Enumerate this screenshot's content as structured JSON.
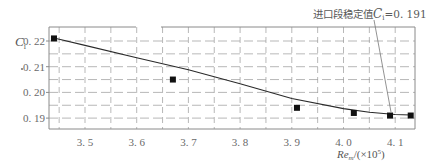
{
  "chart_data": {
    "type": "line",
    "title": "",
    "xlabel": "Re_m/(×10^5)",
    "xlabel_parts": {
      "main": "Re",
      "sub": "m",
      "unit": "/(×10",
      "sup": "5",
      "close": ")"
    },
    "ylabel": "C_i",
    "ylabel_parts": {
      "main": "C",
      "sub": "i"
    },
    "xlim": [
      3.43,
      4.135
    ],
    "ylim": [
      0.1856,
      0.2275
    ],
    "xticks": [
      3.5,
      3.6,
      3.7,
      3.8,
      3.9,
      4.0,
      4.1
    ],
    "xtick_labels": [
      "3. 5",
      "3. 6",
      "3. 7",
      "3. 8",
      "3. 9",
      "4. 0",
      "4. 1"
    ],
    "yticks": [
      0.19,
      0.2,
      0.21,
      0.22
    ],
    "ytick_labels": [
      "0. 19",
      "0. 20",
      "0. 21",
      "0. 22"
    ],
    "grid": {
      "on": true,
      "style": "dashed",
      "x_step": 0.05,
      "y_step": 0.005
    },
    "legend": null,
    "series": [
      {
        "name": "C_i",
        "marker": "square",
        "x": [
          3.44,
          3.67,
          3.91,
          4.02,
          4.09,
          4.13
        ],
        "values": [
          0.221,
          0.205,
          0.194,
          0.192,
          0.191,
          0.191
        ]
      }
    ],
    "fit_curve": {
      "x": [
        3.44,
        3.5,
        3.6,
        3.7,
        3.8,
        3.9,
        4.0,
        4.05,
        4.1,
        4.13
      ],
      "values": [
        0.2212,
        0.2183,
        0.2135,
        0.2088,
        0.2034,
        0.1976,
        0.1937,
        0.1923,
        0.1914,
        0.1912
      ]
    },
    "annotations": [
      {
        "text": "进口段稳定值C_i=0.191",
        "prefix": "进口段稳定值",
        "var": "C",
        "sub": "i",
        "value": "=0. 191",
        "points_to": {
          "x": 4.1,
          "y": 0.191
        }
      }
    ]
  },
  "colors": {
    "frame": "#8a8a8a",
    "grid": "#9a9a9a",
    "curve": "#2a2a2a",
    "marker": "#111111",
    "text": "#666666"
  }
}
